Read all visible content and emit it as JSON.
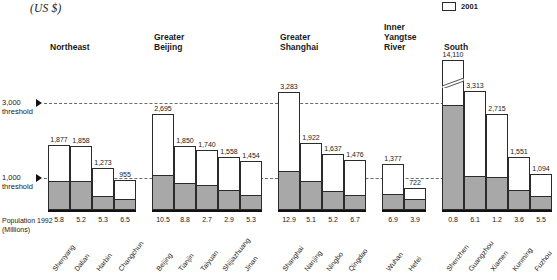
{
  "units_caption": "(US $)",
  "legend": {
    "items": [
      {
        "label": "2001",
        "swatch": "white-box",
        "color": "#ffffff"
      }
    ]
  },
  "axis": {
    "population_label": "Population 1992\n(Millions)",
    "thresholds": [
      {
        "value": 3000,
        "label": "3,000\nthreshold"
      },
      {
        "value": 1000,
        "label": "1,000\nthreshold"
      }
    ]
  },
  "chart_data": {
    "type": "bar",
    "title": "",
    "subtitle": "",
    "xlabel": "",
    "ylabel": "(US $)",
    "ylim": [
      0,
      3500
    ],
    "grid": true,
    "legend_position": "top-right",
    "gridlines": [
      1000,
      3000
    ],
    "annotations": [
      "Axis break (zigzag) on Shenzhen bar: value 14,110 exceeds plotted scale",
      "Gray lower segment of each bar is the 1992 value; white upper segment is the 2001 value"
    ],
    "groups": [
      {
        "name": "Northeast",
        "cities": [
          {
            "name": "Shenyang",
            "value": 1877,
            "value_label": "1,877",
            "lower": 880,
            "population_1992": "5.8"
          },
          {
            "name": "Dalian",
            "value": 1858,
            "value_label": "1,858",
            "lower": 860,
            "population_1992": "5.2"
          },
          {
            "name": "Harbin",
            "value": 1273,
            "value_label": "1,273",
            "lower": 420,
            "population_1992": "5.3"
          },
          {
            "name": "Changchun",
            "value": 955,
            "value_label": "955",
            "lower": 300,
            "population_1992": "6.5"
          }
        ]
      },
      {
        "name": "Greater\nBeijing",
        "cities": [
          {
            "name": "Beijing",
            "value": 2695,
            "value_label": "2,695",
            "lower": 1070,
            "population_1992": "10.5"
          },
          {
            "name": "Tianjin",
            "value": 1850,
            "value_label": "1,850",
            "lower": 800,
            "population_1992": "8.8"
          },
          {
            "name": "Taiyuan",
            "value": 1740,
            "value_label": "1,740",
            "lower": 740,
            "population_1992": "2.7"
          },
          {
            "name": "Shijiazhuang",
            "value": 1558,
            "value_label": "1,558",
            "lower": 600,
            "population_1992": "2.9"
          },
          {
            "name": "Jinan",
            "value": 1454,
            "value_label": "1,454",
            "lower": 440,
            "population_1992": "5.3"
          }
        ]
      },
      {
        "name": "Greater\nShanghai",
        "cities": [
          {
            "name": "Shanghai",
            "value": 3283,
            "value_label": "3,283",
            "lower": 1200,
            "population_1992": "12.9"
          },
          {
            "name": "Nanjing",
            "value": 1922,
            "value_label": "1,922",
            "lower": 880,
            "population_1992": "5.1"
          },
          {
            "name": "Ningbo",
            "value": 1637,
            "value_label": "1,637",
            "lower": 560,
            "population_1992": "5.2"
          },
          {
            "name": "Qingdao",
            "value": 1476,
            "value_label": "1,476",
            "lower": 450,
            "population_1992": "6.7"
          }
        ]
      },
      {
        "name": "Inner\nYangtse\nRiver",
        "cities": [
          {
            "name": "Wuhan",
            "value": 1377,
            "value_label": "1,377",
            "lower": 480,
            "population_1992": "6.9"
          },
          {
            "name": "Hefei",
            "value": 722,
            "value_label": "722",
            "lower": 320,
            "population_1992": "3.9"
          }
        ]
      },
      {
        "name": "South",
        "cities": [
          {
            "name": "Shenzhen",
            "value": 14110,
            "value_label": "14,110",
            "lower": 3250,
            "population_1992": "0.8",
            "broken_axis": true
          },
          {
            "name": "Guangzhou",
            "value": 3313,
            "value_label": "3,313",
            "lower": 1030,
            "population_1992": "6.1"
          },
          {
            "name": "Xiamen",
            "value": 2715,
            "value_label": "2,715",
            "lower": 1000,
            "population_1992": "1.2"
          },
          {
            "name": "Kunming",
            "value": 1551,
            "value_label": "1,551",
            "lower": 590,
            "population_1992": "3.6"
          },
          {
            "name": "Fuzhou",
            "value": 1094,
            "value_label": "1,094",
            "lower": 400,
            "population_1992": "5.5"
          }
        ]
      }
    ]
  }
}
